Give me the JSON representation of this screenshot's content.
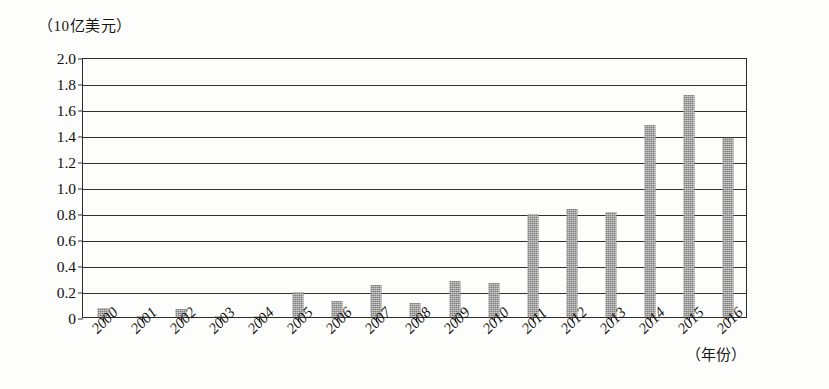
{
  "chart_data": {
    "type": "bar",
    "title": "",
    "subtitle": "",
    "ylabel": "（10亿美元）",
    "xlabel": "（年份）",
    "categories": [
      "2000",
      "2001",
      "2002",
      "2003",
      "2004",
      "2005",
      "2006",
      "2007",
      "2008",
      "2009",
      "2010",
      "2011",
      "2012",
      "2013",
      "2014",
      "2015",
      "2016"
    ],
    "values": [
      0.07,
      0.01,
      0.06,
      0.01,
      0.01,
      0.19,
      0.12,
      0.25,
      0.11,
      0.28,
      0.26,
      0.79,
      0.83,
      0.81,
      1.48,
      1.71,
      1.38
    ],
    "series": [
      {
        "name": "",
        "values": [
          0.07,
          0.01,
          0.06,
          0.01,
          0.01,
          0.19,
          0.12,
          0.25,
          0.11,
          0.28,
          0.26,
          0.79,
          0.83,
          0.81,
          1.48,
          1.71,
          1.38
        ]
      }
    ],
    "ylim": [
      0,
      2.0
    ],
    "ytick_labels": [
      "2.0",
      "1.8",
      "1.6",
      "1.4",
      "1.2",
      "1.0",
      "0.8",
      "0.6",
      "0.4",
      "0.2",
      "0"
    ],
    "ytick_values": [
      2.0,
      1.8,
      1.6,
      1.4,
      1.2,
      1.0,
      0.8,
      0.6,
      0.4,
      0.2,
      0
    ],
    "grid": true,
    "legend": "none",
    "bar_color": "#9b9b9b",
    "axis_color": "#2b2b2b"
  }
}
